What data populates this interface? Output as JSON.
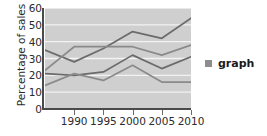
{
  "chart_data": {
    "type": "line",
    "title": "",
    "xlabel": "",
    "ylabel": "Percentage of sales",
    "x": [
      "",
      "1990",
      "1995",
      "2000",
      "2005",
      "2010"
    ],
    "xtick_labels": [
      "1990",
      "1995",
      "2000",
      "2005",
      "2010"
    ],
    "ytick_labels": [
      "0",
      "10",
      "20",
      "30",
      "40",
      "50",
      "60"
    ],
    "ylim": [
      0,
      60
    ],
    "ytick_step": 10,
    "grid": "horizontal-white",
    "legend_position": "right",
    "series": [
      {
        "name": "series-1",
        "values": [
          35,
          28,
          36,
          46,
          42,
          54
        ]
      },
      {
        "name": "series-2",
        "values": [
          23,
          37,
          37,
          37,
          32,
          38
        ]
      },
      {
        "name": "series-3",
        "values": [
          21,
          20,
          22,
          32,
          24,
          31
        ]
      },
      {
        "name": "series-4",
        "values": [
          14,
          21,
          17,
          26,
          16,
          16
        ]
      }
    ],
    "legend": [
      {
        "label": "graph",
        "color": "#8d8d8d"
      }
    ],
    "colors": {
      "plot_background": "#cfcfcf",
      "gridline": "#f2f2f2",
      "axis": "#4a4a4a",
      "line_dark": "#6b6b6b",
      "line_mid": "#8a8a8a",
      "text": "#2b2b2b"
    }
  }
}
